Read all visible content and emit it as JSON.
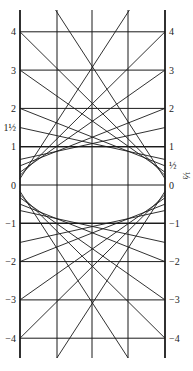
{
  "diagram": {
    "left_axis_labels": [
      {
        "value": 4,
        "text": "4"
      },
      {
        "value": 3,
        "text": "3"
      },
      {
        "value": 2,
        "text": "2"
      },
      {
        "value": 1.5,
        "text": "1½"
      },
      {
        "value": 1,
        "text": "1"
      },
      {
        "value": 0,
        "text": "0"
      },
      {
        "value": -1,
        "text": "−1"
      },
      {
        "value": -2,
        "text": "−2"
      },
      {
        "value": -3,
        "text": "−3"
      },
      {
        "value": -4,
        "text": "−4"
      }
    ],
    "right_axis_labels": [
      {
        "value": 4,
        "text": "4"
      },
      {
        "value": 3,
        "text": "3"
      },
      {
        "value": 2,
        "text": "2"
      },
      {
        "value": 1,
        "text": "1"
      },
      {
        "value": 0.5,
        "text": "½"
      },
      {
        "value": 0,
        "text": "0"
      },
      {
        "value": -1,
        "text": "−1"
      },
      {
        "value": -2,
        "text": "−2"
      },
      {
        "value": -3,
        "text": "−3"
      },
      {
        "value": -4,
        "text": "−4"
      }
    ],
    "side_note": "⅓",
    "grid_values": [
      4,
      3,
      2,
      1,
      0,
      -1,
      -2,
      -3,
      -4
    ],
    "tangent_intercepts": [
      1,
      1.5,
      2,
      3,
      4,
      6
    ],
    "intercept_product": 1,
    "line_color": "#1a1a1a"
  }
}
